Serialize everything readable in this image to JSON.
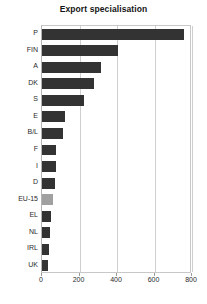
{
  "chart_data": {
    "type": "bar",
    "orientation": "horizontal",
    "title": "Export specialisation",
    "xlabel": "",
    "ylabel": "",
    "categories": [
      "P",
      "FIN",
      "A",
      "DK",
      "S",
      "E",
      "B/L",
      "F",
      "I",
      "D",
      "EU-15",
      "EL",
      "NL",
      "IRL",
      "UK"
    ],
    "values": [
      757,
      405,
      317,
      275,
      225,
      120,
      112,
      75,
      72,
      68,
      60,
      50,
      45,
      38,
      30
    ],
    "xlim": [
      0,
      800
    ],
    "xticks": [
      0,
      200,
      400,
      600,
      800
    ],
    "xtick_labels": [
      "0",
      "200",
      "400",
      "600",
      "800"
    ],
    "grid": true,
    "legend": false,
    "highlight_category": "EU-15",
    "bar_color": "#333333",
    "highlight_color": "#a0a0a0"
  }
}
